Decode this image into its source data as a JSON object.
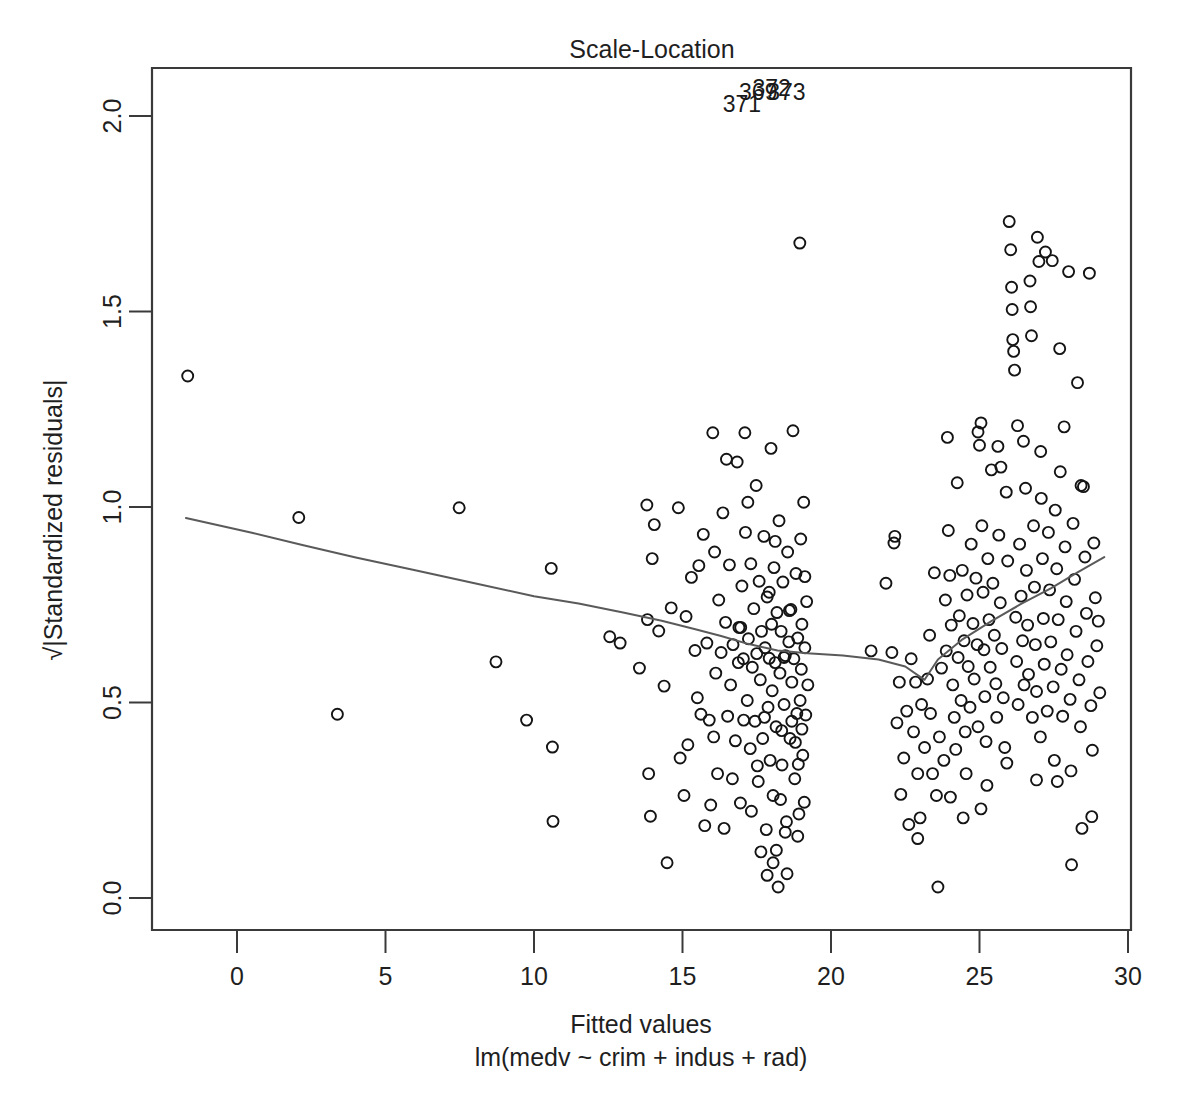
{
  "plot": {
    "title": "Scale-Location",
    "xlabel": "Fitted values",
    "sublabel": "lm(medv ~ crim + indus + rad)",
    "ylabel": "√|Standardized residuals|",
    "point_color": "#141414",
    "line_color": "#5a5a5a",
    "axis_color": "#3a3a3a",
    "background": "#ffffff"
  },
  "chart_data": {
    "type": "scatter",
    "title": "Scale-Location",
    "xlabel": "Fitted values",
    "sublabel": "lm(medv ~ crim + indus + rad)",
    "ylabel": "√|Standardized residuals|",
    "xlim": [
      -2.6,
      30.1
    ],
    "ylim": [
      -0.06,
      2.12
    ],
    "xticks": [
      0,
      5,
      10,
      15,
      20,
      25,
      30
    ],
    "xticklabels": [
      "0",
      "5",
      "10",
      "15",
      "20",
      "25",
      "30"
    ],
    "yticks": [
      0.0,
      0.5,
      1.0,
      1.5,
      2.0
    ],
    "yticklabels": [
      "0.0",
      "0.5",
      "1.0",
      "1.5",
      "2.0"
    ],
    "grid": false,
    "legend": false,
    "marker": "open-circle",
    "marker_size": 11,
    "annotations": [
      {
        "label": "371",
        "x": 17.0,
        "y": 2.01
      },
      {
        "label": "369",
        "x": 17.55,
        "y": 2.04
      },
      {
        "label": "372",
        "x": 18.0,
        "y": 2.05
      },
      {
        "label": "373",
        "x": 18.5,
        "y": 2.04
      }
    ],
    "smoother": {
      "name": "lowess",
      "x": [
        -1.72,
        0.5,
        2.2,
        4.0,
        6.0,
        8.0,
        10.0,
        11.5,
        13.0,
        14.3,
        15.4,
        16.3,
        17.2,
        18.2,
        19.2,
        20.4,
        21.6,
        22.5,
        23.15,
        23.6,
        24.4,
        25.4,
        26.4,
        27.4,
        28.3,
        29.2
      ],
      "y": [
        0.972,
        0.934,
        0.903,
        0.871,
        0.838,
        0.805,
        0.772,
        0.753,
        0.73,
        0.709,
        0.688,
        0.67,
        0.65,
        0.633,
        0.626,
        0.62,
        0.61,
        0.592,
        0.558,
        0.61,
        0.66,
        0.708,
        0.752,
        0.792,
        0.833,
        0.872
      ]
    },
    "points": [
      [
        -1.66,
        1.335
      ],
      [
        2.08,
        0.973
      ],
      [
        3.38,
        0.47
      ],
      [
        7.48,
        0.998
      ],
      [
        8.72,
        0.604
      ],
      [
        9.75,
        0.455
      ],
      [
        10.58,
        0.843
      ],
      [
        10.62,
        0.386
      ],
      [
        10.64,
        0.196
      ],
      [
        12.55,
        0.668
      ],
      [
        12.9,
        0.652
      ],
      [
        13.55,
        0.588
      ],
      [
        13.8,
        1.005
      ],
      [
        13.82,
        0.712
      ],
      [
        13.86,
        0.318
      ],
      [
        13.92,
        0.209
      ],
      [
        14.05,
        0.955
      ],
      [
        14.2,
        0.683
      ],
      [
        14.48,
        0.09
      ],
      [
        14.86,
        0.998
      ],
      [
        14.92,
        0.358
      ],
      [
        15.05,
        0.262
      ],
      [
        15.12,
        0.72
      ],
      [
        15.3,
        0.82
      ],
      [
        15.42,
        0.633
      ],
      [
        15.5,
        0.512
      ],
      [
        15.62,
        0.47
      ],
      [
        15.7,
        0.93
      ],
      [
        15.82,
        0.652
      ],
      [
        15.9,
        0.455
      ],
      [
        16.02,
        1.19
      ],
      [
        16.08,
        0.885
      ],
      [
        16.12,
        0.575
      ],
      [
        16.18,
        0.318
      ],
      [
        16.22,
        0.762
      ],
      [
        16.3,
        0.628
      ],
      [
        16.36,
        0.985
      ],
      [
        16.45,
        0.705
      ],
      [
        16.52,
        0.465
      ],
      [
        16.58,
        0.852
      ],
      [
        16.62,
        0.545
      ],
      [
        16.7,
        0.648
      ],
      [
        16.78,
        0.402
      ],
      [
        16.84,
        1.115
      ],
      [
        16.9,
        0.692
      ],
      [
        16.95,
        0.243
      ],
      [
        17.0,
        0.798
      ],
      [
        17.05,
        0.612
      ],
      [
        17.1,
        1.19
      ],
      [
        17.12,
        0.935
      ],
      [
        17.18,
        0.505
      ],
      [
        17.22,
        0.663
      ],
      [
        17.28,
        0.382
      ],
      [
        17.3,
        0.855
      ],
      [
        17.35,
        0.59
      ],
      [
        17.4,
        0.74
      ],
      [
        17.44,
        0.452
      ],
      [
        17.48,
        1.055
      ],
      [
        17.5,
        0.625
      ],
      [
        17.55,
        0.298
      ],
      [
        17.58,
        0.81
      ],
      [
        17.62,
        0.558
      ],
      [
        17.66,
        0.682
      ],
      [
        17.7,
        0.408
      ],
      [
        17.74,
        0.925
      ],
      [
        17.78,
        0.64
      ],
      [
        17.82,
        0.175
      ],
      [
        17.85,
        0.77
      ],
      [
        17.88,
        0.488
      ],
      [
        17.92,
        0.613
      ],
      [
        17.95,
        0.352
      ],
      [
        17.98,
        1.15
      ],
      [
        18.0,
        0.7
      ],
      [
        18.02,
        0.53
      ],
      [
        18.05,
        0.262
      ],
      [
        18.08,
        0.845
      ],
      [
        18.12,
        0.602
      ],
      [
        18.15,
        0.438
      ],
      [
        18.18,
        0.73
      ],
      [
        18.22,
        0.028
      ],
      [
        18.25,
        0.965
      ],
      [
        18.28,
        0.575
      ],
      [
        18.32,
        0.682
      ],
      [
        18.35,
        0.34
      ],
      [
        18.38,
        0.808
      ],
      [
        18.42,
        0.495
      ],
      [
        18.46,
        0.62
      ],
      [
        18.5,
        0.195
      ],
      [
        18.54,
        0.885
      ],
      [
        18.58,
        0.655
      ],
      [
        18.62,
        0.408
      ],
      [
        18.65,
        0.738
      ],
      [
        18.68,
        0.552
      ],
      [
        18.72,
        1.195
      ],
      [
        18.75,
        0.612
      ],
      [
        18.78,
        0.305
      ],
      [
        18.82,
        0.83
      ],
      [
        18.85,
        0.472
      ],
      [
        18.88,
        0.665
      ],
      [
        18.92,
        0.215
      ],
      [
        18.95,
        1.675
      ],
      [
        18.98,
        0.918
      ],
      [
        19.0,
        0.585
      ],
      [
        19.02,
        0.7
      ],
      [
        19.05,
        0.365
      ],
      [
        19.08,
        1.012
      ],
      [
        19.12,
        0.64
      ],
      [
        19.15,
        0.468
      ],
      [
        19.18,
        0.758
      ],
      [
        19.22,
        0.545
      ],
      [
        21.35,
        0.632
      ],
      [
        21.85,
        0.805
      ],
      [
        22.12,
        0.908
      ],
      [
        22.15,
        0.925
      ],
      [
        22.22,
        0.448
      ],
      [
        22.3,
        0.552
      ],
      [
        22.35,
        0.265
      ],
      [
        22.45,
        0.358
      ],
      [
        22.55,
        0.478
      ],
      [
        22.62,
        0.188
      ],
      [
        22.7,
        0.612
      ],
      [
        22.78,
        0.425
      ],
      [
        22.85,
        0.552
      ],
      [
        22.92,
        0.318
      ],
      [
        23.0,
        0.205
      ],
      [
        23.05,
        0.495
      ],
      [
        23.15,
        0.385
      ],
      [
        23.25,
        0.56
      ],
      [
        23.35,
        0.472
      ],
      [
        23.42,
        0.318
      ],
      [
        23.55,
        0.262
      ],
      [
        23.6,
        0.028
      ],
      [
        23.65,
        0.412
      ],
      [
        23.72,
        0.588
      ],
      [
        23.8,
        0.352
      ],
      [
        23.85,
        0.762
      ],
      [
        23.88,
        0.632
      ],
      [
        23.92,
        1.178
      ],
      [
        23.95,
        0.94
      ],
      [
        24.0,
        0.825
      ],
      [
        24.05,
        0.698
      ],
      [
        24.1,
        0.545
      ],
      [
        24.15,
        0.462
      ],
      [
        24.2,
        0.38
      ],
      [
        24.28,
        0.615
      ],
      [
        24.32,
        0.722
      ],
      [
        24.38,
        0.505
      ],
      [
        24.42,
        0.838
      ],
      [
        24.48,
        0.658
      ],
      [
        24.52,
        0.425
      ],
      [
        24.58,
        0.775
      ],
      [
        24.62,
        0.592
      ],
      [
        24.68,
        0.488
      ],
      [
        24.72,
        0.905
      ],
      [
        24.78,
        0.702
      ],
      [
        24.82,
        0.56
      ],
      [
        24.88,
        0.818
      ],
      [
        24.92,
        0.648
      ],
      [
        24.95,
        0.438
      ],
      [
        25.0,
        1.158
      ],
      [
        25.05,
        1.215
      ],
      [
        25.08,
        0.952
      ],
      [
        25.12,
        0.782
      ],
      [
        25.15,
        0.635
      ],
      [
        25.18,
        0.515
      ],
      [
        25.22,
        0.4
      ],
      [
        25.28,
        0.868
      ],
      [
        25.32,
        0.712
      ],
      [
        25.36,
        0.59
      ],
      [
        25.4,
        1.095
      ],
      [
        25.45,
        0.805
      ],
      [
        25.5,
        0.672
      ],
      [
        25.55,
        0.548
      ],
      [
        25.58,
        0.462
      ],
      [
        25.62,
        1.155
      ],
      [
        25.65,
        0.928
      ],
      [
        25.7,
        0.755
      ],
      [
        25.75,
        0.638
      ],
      [
        25.8,
        0.512
      ],
      [
        25.85,
        0.385
      ],
      [
        25.9,
        1.038
      ],
      [
        25.95,
        0.862
      ],
      [
        26.0,
        1.73
      ],
      [
        26.05,
        1.658
      ],
      [
        26.08,
        1.562
      ],
      [
        26.1,
        1.505
      ],
      [
        26.12,
        1.428
      ],
      [
        26.15,
        1.398
      ],
      [
        26.18,
        1.35
      ],
      [
        26.22,
        0.718
      ],
      [
        26.25,
        0.605
      ],
      [
        26.3,
        0.495
      ],
      [
        26.35,
        0.905
      ],
      [
        26.4,
        0.772
      ],
      [
        26.45,
        0.658
      ],
      [
        26.5,
        0.545
      ],
      [
        26.55,
        1.048
      ],
      [
        26.58,
        0.838
      ],
      [
        26.62,
        0.698
      ],
      [
        26.65,
        0.572
      ],
      [
        26.7,
        1.578
      ],
      [
        26.72,
        1.512
      ],
      [
        26.75,
        1.438
      ],
      [
        26.78,
        0.462
      ],
      [
        26.82,
        0.952
      ],
      [
        26.85,
        0.795
      ],
      [
        26.88,
        0.648
      ],
      [
        26.92,
        0.528
      ],
      [
        26.95,
        1.69
      ],
      [
        27.0,
        1.628
      ],
      [
        27.05,
        0.412
      ],
      [
        27.08,
        1.022
      ],
      [
        27.12,
        0.868
      ],
      [
        27.15,
        0.715
      ],
      [
        27.18,
        0.598
      ],
      [
        27.22,
        1.652
      ],
      [
        27.28,
        0.478
      ],
      [
        27.32,
        0.935
      ],
      [
        27.36,
        0.788
      ],
      [
        27.4,
        0.655
      ],
      [
        27.45,
        1.63
      ],
      [
        27.48,
        0.54
      ],
      [
        27.52,
        0.352
      ],
      [
        27.55,
        0.992
      ],
      [
        27.6,
        0.842
      ],
      [
        27.65,
        0.712
      ],
      [
        27.7,
        1.405
      ],
      [
        27.75,
        0.585
      ],
      [
        27.8,
        0.465
      ],
      [
        27.85,
        1.205
      ],
      [
        27.88,
        0.898
      ],
      [
        27.92,
        0.758
      ],
      [
        27.95,
        0.622
      ],
      [
        28.0,
        1.602
      ],
      [
        28.05,
        0.508
      ],
      [
        28.1,
        0.085
      ],
      [
        28.15,
        0.958
      ],
      [
        28.2,
        0.815
      ],
      [
        28.25,
        0.682
      ],
      [
        28.3,
        1.318
      ],
      [
        28.35,
        0.558
      ],
      [
        28.4,
        0.438
      ],
      [
        28.45,
        0.178
      ],
      [
        28.5,
        1.052
      ],
      [
        28.55,
        0.872
      ],
      [
        28.6,
        0.728
      ],
      [
        28.65,
        0.605
      ],
      [
        28.7,
        1.598
      ],
      [
        28.75,
        0.492
      ],
      [
        28.8,
        0.378
      ],
      [
        28.85,
        0.908
      ],
      [
        28.9,
        0.768
      ],
      [
        28.95,
        0.645
      ],
      [
        29.0,
        0.708
      ],
      [
        29.05,
        0.525
      ],
      [
        16.05,
        0.412
      ],
      [
        16.48,
        1.122
      ],
      [
        17.06,
        0.455
      ],
      [
        17.52,
        0.338
      ],
      [
        18.12,
        0.912
      ],
      [
        18.46,
        0.168
      ],
      [
        18.68,
        0.452
      ],
      [
        18.9,
        0.342
      ],
      [
        19.1,
        0.245
      ],
      [
        14.62,
        0.742
      ],
      [
        15.18,
        0.392
      ],
      [
        15.55,
        0.85
      ],
      [
        16.68,
        0.305
      ],
      [
        17.2,
        1.012
      ],
      [
        17.76,
        0.462
      ],
      [
        18.3,
        0.252
      ],
      [
        18.6,
        0.735
      ],
      [
        18.96,
        0.505
      ],
      [
        15.75,
        0.185
      ],
      [
        16.88,
        0.602
      ],
      [
        17.32,
        0.222
      ],
      [
        17.92,
        0.782
      ],
      [
        18.42,
        0.615
      ],
      [
        18.8,
        0.398
      ],
      [
        19.12,
        0.822
      ],
      [
        23.32,
        0.672
      ],
      [
        24.02,
        0.258
      ],
      [
        24.55,
        0.318
      ],
      [
        25.25,
        0.288
      ],
      [
        25.92,
        0.345
      ],
      [
        26.28,
        1.208
      ],
      [
        26.92,
        0.302
      ],
      [
        27.62,
        0.298
      ],
      [
        28.08,
        0.325
      ],
      [
        28.78,
        0.208
      ],
      [
        22.05,
        0.628
      ],
      [
        22.92,
        0.152
      ],
      [
        23.48,
        0.832
      ],
      [
        24.25,
        1.062
      ],
      [
        24.95,
        1.192
      ],
      [
        25.72,
        1.102
      ],
      [
        26.48,
        1.168
      ],
      [
        27.06,
        1.142
      ],
      [
        27.72,
        1.09
      ],
      [
        28.42,
        1.055
      ],
      [
        13.98,
        0.868
      ],
      [
        14.38,
        0.542
      ],
      [
        15.95,
        0.238
      ],
      [
        16.4,
        0.178
      ],
      [
        17.64,
        0.118
      ],
      [
        18.16,
        0.122
      ],
      [
        18.52,
        0.062
      ],
      [
        18.88,
        0.158
      ],
      [
        17.85,
        0.058
      ],
      [
        18.05,
        0.09
      ],
      [
        16.96,
        0.692
      ],
      [
        18.34,
        0.428
      ],
      [
        19.02,
        0.432
      ],
      [
        24.45,
        0.205
      ],
      [
        25.05,
        0.228
      ]
    ]
  }
}
